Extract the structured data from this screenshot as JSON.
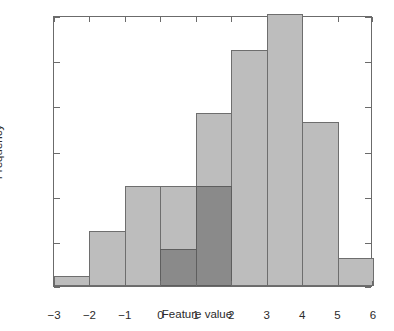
{
  "chart_data": {
    "type": "bar",
    "title": "",
    "subtitle": "",
    "xlabel": "Feature value",
    "ylabel": "Frequency",
    "xlim": [
      -3,
      6
    ],
    "ylim": [
      0,
      30
    ],
    "grid": false,
    "legend": null,
    "xticks": [
      "−3",
      "−2",
      "−1",
      "0",
      "1",
      "2",
      "3",
      "4",
      "5",
      "6"
    ],
    "xtick_values": [
      -3,
      -2,
      -1,
      0,
      1,
      2,
      3,
      4,
      5,
      6
    ],
    "yticks": [
      "0",
      "5",
      "10",
      "15",
      "20",
      "25",
      "30"
    ],
    "ytick_values": [
      0,
      5,
      10,
      15,
      20,
      25,
      30
    ],
    "bin_edges": [
      -3,
      -2,
      -1,
      0,
      1,
      2,
      3,
      4,
      5,
      6
    ],
    "bin_width": 1,
    "series": [
      {
        "name": "light-histogram",
        "color": "#bdbdbd",
        "edge_color": "#6e6e6e",
        "bins": [
          {
            "x0": -3,
            "x1": -2,
            "value": 1
          },
          {
            "x0": -2,
            "x1": -1,
            "value": 6
          },
          {
            "x0": -1,
            "x1": 0,
            "value": 11
          },
          {
            "x0": 0,
            "x1": 1,
            "value": 11
          },
          {
            "x0": 1,
            "x1": 2,
            "value": 19
          },
          {
            "x0": 2,
            "x1": 3,
            "value": 26
          },
          {
            "x0": 3,
            "x1": 4,
            "value": 30
          },
          {
            "x0": 4,
            "x1": 5,
            "value": 18
          },
          {
            "x0": 5,
            "x1": 6,
            "value": 3
          }
        ]
      },
      {
        "name": "dark-histogram-overlay",
        "color": "#8a8a8a",
        "edge_color": "#5e5e5e",
        "bins": [
          {
            "x0": 0,
            "x1": 1,
            "value": 4
          },
          {
            "x0": 1,
            "x1": 2,
            "value": 11
          }
        ]
      }
    ]
  }
}
